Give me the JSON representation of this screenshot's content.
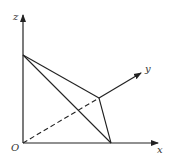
{
  "diagram": {
    "type": "3d-coordinate-figure",
    "labels": {
      "z": "z",
      "y": "y",
      "x": "x",
      "origin": "O"
    },
    "colors": {
      "stroke": "#222222",
      "label": "#333333",
      "background": "#ffffff"
    },
    "points": {
      "O": [
        23,
        143
      ],
      "Z": [
        23,
        55
      ],
      "X": [
        111,
        143
      ],
      "P": [
        99,
        98
      ]
    },
    "axes": {
      "z_end": [
        23,
        14
      ],
      "x_end": [
        158,
        143
      ],
      "y_end": [
        141,
        73
      ]
    }
  }
}
